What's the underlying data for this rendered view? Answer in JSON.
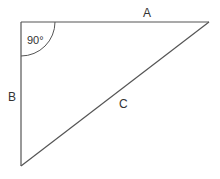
{
  "diagram": {
    "type": "right-triangle",
    "colors": {
      "stroke": "#555555",
      "text": "#333333",
      "background": "#ffffff"
    },
    "vertices": {
      "right_angle": [
        21,
        22
      ],
      "top_right": [
        209,
        22
      ],
      "bottom_left": [
        21,
        166
      ]
    },
    "sides": [
      {
        "id": "A",
        "label": "A",
        "from": "right_angle",
        "to": "top_right"
      },
      {
        "id": "B",
        "label": "B",
        "from": "right_angle",
        "to": "bottom_left"
      },
      {
        "id": "C",
        "label": "C",
        "from": "top_right",
        "to": "bottom_left",
        "role": "hypotenuse"
      }
    ],
    "angle": {
      "label": "90°",
      "vertex": "right_angle",
      "arc_radius": 34
    }
  }
}
